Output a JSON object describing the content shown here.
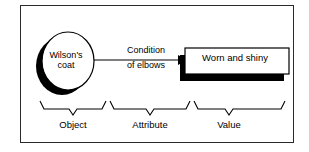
{
  "figure": {
    "type": "object-attribute-value-diagram",
    "frame": {
      "border_color": "#2a2a2a",
      "background": "#ffffff"
    },
    "ink_color": "#000000",
    "shadow_color": "#000000"
  },
  "object_node": {
    "shape": "ellipse",
    "label_line_1": "Wilson's",
    "label_line_2": "coat",
    "label_full": "Wilson's coat"
  },
  "edge": {
    "label_line_1": "Condition",
    "label_line_2": "of elbows",
    "label_full": "Condition of elbows",
    "arrowhead": "filled-triangle",
    "direction": "object-to-value"
  },
  "value_node": {
    "shape": "rectangle",
    "label": "Worn and shiny",
    "has_drop_shadow": true
  },
  "brackets": [
    {
      "label": "Object"
    },
    {
      "label": "Attribute"
    },
    {
      "label": "Value"
    }
  ]
}
